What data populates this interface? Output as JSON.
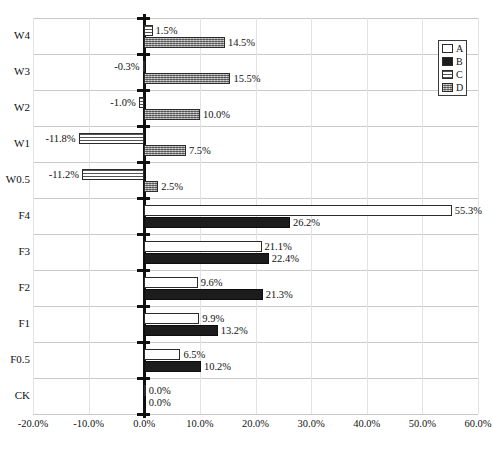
{
  "chart_data": {
    "type": "bar",
    "orientation": "horizontal",
    "title": "",
    "xlabel": "",
    "ylabel": "",
    "xlim": [
      -20.0,
      60.0
    ],
    "xticks": [
      "-20.0%",
      "-10.0%",
      "0.0%",
      "10.0%",
      "20.0%",
      "30.0%",
      "40.0%",
      "50.0%",
      "60.0%"
    ],
    "xtick_values": [
      -20,
      -10,
      0,
      10,
      20,
      30,
      40,
      50,
      60
    ],
    "grid": true,
    "legend_position": "right",
    "categories": [
      "W4",
      "W3",
      "W2",
      "W1",
      "W0.5",
      "F4",
      "F3",
      "F2",
      "F1",
      "F0.5",
      "CK"
    ],
    "series": [
      {
        "name": "A",
        "pattern": "solid-white",
        "values": [
          null,
          null,
          null,
          null,
          null,
          55.3,
          21.1,
          9.6,
          9.9,
          6.5,
          0.0
        ],
        "labels": [
          "",
          "",
          "",
          "",
          "",
          "55.3%",
          "21.1%",
          "9.6%",
          "9.9%",
          "6.5%",
          "0.0%"
        ]
      },
      {
        "name": "B",
        "pattern": "solid-black",
        "values": [
          null,
          null,
          null,
          null,
          null,
          26.2,
          22.4,
          21.3,
          13.2,
          10.2,
          0.0
        ],
        "labels": [
          "",
          "",
          "",
          "",
          "",
          "26.2%",
          "22.4%",
          "21.3%",
          "13.2%",
          "10.2%",
          "0.0%"
        ]
      },
      {
        "name": "C",
        "pattern": "horizontal-lines",
        "values": [
          1.5,
          -0.3,
          -1.0,
          -11.8,
          -11.2,
          null,
          null,
          null,
          null,
          null,
          null
        ],
        "labels": [
          "1.5%",
          "-0.3%",
          "-1.0%",
          "-11.8%",
          "-11.2%",
          "",
          "",
          "",
          "",
          "",
          ""
        ]
      },
      {
        "name": "D",
        "pattern": "gray-dotted",
        "values": [
          14.5,
          15.5,
          10.0,
          7.5,
          2.5,
          null,
          null,
          null,
          null,
          null,
          null
        ],
        "labels": [
          "14.5%",
          "15.5%",
          "10.0%",
          "7.5%",
          "2.5%",
          "",
          "",
          "",
          "",
          "",
          ""
        ]
      }
    ]
  },
  "legend": {
    "items": [
      {
        "label": "A"
      },
      {
        "label": "B"
      },
      {
        "label": "C"
      },
      {
        "label": "D"
      }
    ]
  },
  "colors": {
    "axis": "#111111",
    "gridline": "#c9c9c9",
    "series_a": "#ffffff",
    "series_b": "#1c1c1c",
    "series_c": "#555555",
    "series_d": "#8c8c8c"
  }
}
